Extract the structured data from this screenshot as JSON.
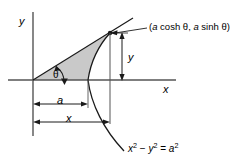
{
  "figure": {
    "kind": "hyperbolic-sector-diagram",
    "axes": {
      "y_axis_label": "y",
      "x_axis_label": "x"
    },
    "angle_label": "θ",
    "point_label": {
      "open_paren": "(",
      "a1": "a",
      "cosh": " cosh ",
      "theta1": "θ",
      "comma": ", ",
      "a2": "a",
      "sinh": " sinh ",
      "theta2": "θ",
      "close_paren": ")",
      "full": "(a cosh θ, a sinh θ)"
    },
    "dimensions": {
      "horizontal_a": "a",
      "horizontal_x": "x",
      "vertical_y": "y"
    },
    "curve_equation": {
      "x_var": "x",
      "x_exp": "2",
      "minus": " − ",
      "y_var": "y",
      "y_exp": "2",
      "equals": " = ",
      "a_var": "a",
      "a_exp": "2",
      "full": "x² − y² = a²"
    },
    "colors": {
      "stroke": "#1a1a1a",
      "axis": "#555555",
      "shade_fill": "#c9c9c9",
      "background": "#ffffff",
      "text": "#000000"
    }
  }
}
